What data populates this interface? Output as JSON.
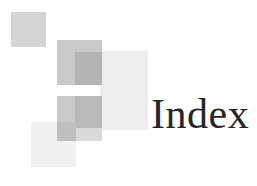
{
  "page": {
    "background_color": "#ffffff",
    "width": 257,
    "height": 186
  },
  "heading": {
    "text": "Index",
    "color": "#262626"
  },
  "decoration": {
    "name": "overlapping-squares-motif",
    "squares": [
      {
        "id": "sq-topleft",
        "label": "top-left-square",
        "color": "#d4d4d4"
      },
      {
        "id": "sq-large-light",
        "label": "large-light-square",
        "color": "#ededed"
      },
      {
        "id": "sq-bottomleft-light",
        "label": "bottom-left-light-square",
        "color": "#f0f0f0"
      },
      {
        "id": "sq-mid-upper",
        "label": "upper-medium-square",
        "color": "#c9c9c9"
      },
      {
        "id": "sq-mid-lower",
        "label": "lower-medium-square",
        "color": "#c9c9c9"
      },
      {
        "id": "sq-overlap-upper",
        "label": "upper-overlap-patch",
        "color": "#b4b4b4"
      },
      {
        "id": "sq-overlap-lower",
        "label": "lower-overlap-patch",
        "color": "#b9b9b9"
      },
      {
        "id": "sq-overlap-bottom",
        "label": "bottom-overlap-patch",
        "color": "#bfbfbf"
      },
      {
        "id": "sq-overlap-bottom-right",
        "label": "bottom-right-overlap-patch",
        "color": "#d9d9d9"
      }
    ]
  }
}
